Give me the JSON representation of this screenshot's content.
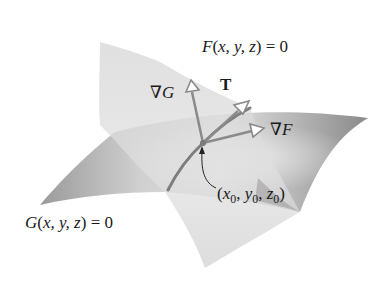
{
  "diagram": {
    "type": "intersecting-surfaces",
    "surfaces": [
      {
        "id": "F",
        "equation_fn": "F",
        "args": "x, y, z",
        "rhs": "0",
        "label": "F(x, y, z) = 0"
      },
      {
        "id": "G",
        "equation_fn": "G",
        "args": "x, y, z",
        "rhs": "0",
        "label": "G(x, y, z) = 0"
      }
    ],
    "vectors": [
      {
        "id": "gradG",
        "nabla": "∇",
        "name": "G",
        "label": "∇G"
      },
      {
        "id": "T",
        "name": "T",
        "label": "T"
      },
      {
        "id": "gradF",
        "nabla": "∇",
        "name": "F",
        "label": "∇F"
      }
    ],
    "point": {
      "label": "(x0, y0, z0)",
      "open": "(",
      "x": "x",
      "xs": "0",
      "y": "y",
      "ys": "0",
      "z": "z",
      "zs": "0",
      "close": ")",
      "sep": ", "
    },
    "colors": {
      "background": "#ffffff",
      "surface_F": "#d9d9d9",
      "surface_G": "#bdbdbd",
      "surface_G_dark": "#8f8f8f",
      "vector": "#8a8a8a",
      "curve": "#7d7d7d",
      "text": "#1a1a1a"
    }
  }
}
